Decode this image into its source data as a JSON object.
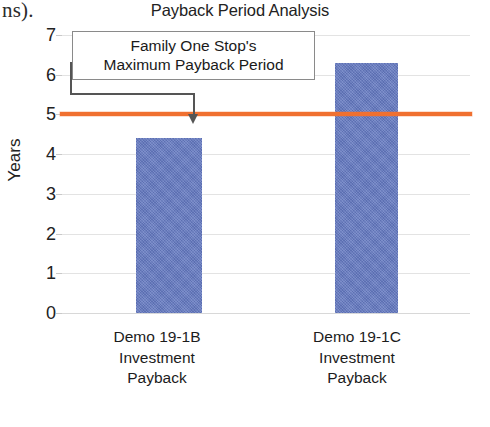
{
  "page": {
    "scan_artifact_text": "ns)."
  },
  "chart_data": {
    "type": "bar",
    "title": "Payback Period Analysis",
    "xlabel": "",
    "ylabel": "Years",
    "ylim": [
      0,
      7
    ],
    "ytick_values": [
      7,
      6,
      5,
      4,
      3,
      2,
      1,
      0
    ],
    "ytick_labels": [
      "7",
      "6",
      "5",
      "4",
      "3",
      "2",
      "1",
      "0"
    ],
    "grid": true,
    "legend": "none",
    "categories": [
      "Demo 19-1B Investment Payback",
      "Demo 19-1C Investment Payback"
    ],
    "category_label_lines": [
      [
        "Demo 19-1B",
        "Investment",
        "Payback"
      ],
      [
        "Demo 19-1C",
        "Investment",
        "Payback"
      ]
    ],
    "values": [
      4.4,
      6.3
    ],
    "bar_color": "#6378c0",
    "threshold": {
      "value": 5,
      "color": "#f07030",
      "label": "Family One Stop's Maximum Payback Period"
    },
    "annotation": {
      "lines": [
        "Family One Stop's",
        "Maximum Payback Period"
      ],
      "points_to": "threshold-line"
    }
  }
}
